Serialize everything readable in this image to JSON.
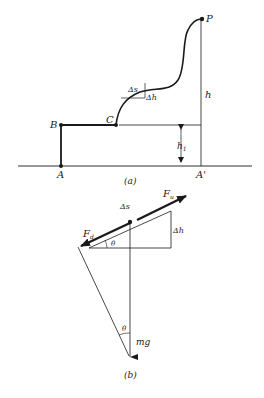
{
  "figure_a": {
    "caption": "(a)",
    "points": {
      "A": "A",
      "B": "B",
      "C": "C",
      "P": "P",
      "A_prime": "A'"
    },
    "labels": {
      "h": "h",
      "h1": "h",
      "h1_sub": "1",
      "delta_s": "Δs",
      "delta_h": "Δh"
    }
  },
  "figure_b": {
    "caption": "(b)",
    "labels": {
      "F_u": "F",
      "F_u_sub": "u",
      "F_d": "F",
      "F_d_sub": "d",
      "delta_s": "Δs",
      "delta_h": "Δh",
      "theta_top": "θ",
      "theta_bottom": "θ",
      "mg": "mg"
    }
  },
  "colors": {
    "ink": "#1a1a1a",
    "background": "#ffffff"
  }
}
